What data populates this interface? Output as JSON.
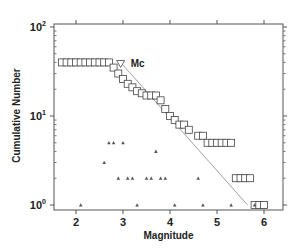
{
  "chart_data": {
    "type": "scatter",
    "title": "",
    "xlabel": "Magnitude",
    "ylabel": "Cumulative Number",
    "xlim": [
      1.6,
      6.4
    ],
    "ylim": [
      0.9,
      110
    ],
    "yscale": "log",
    "grid": false,
    "x_ticks": [
      2,
      3,
      4,
      5,
      6
    ],
    "y_ticks": [
      {
        "value": 1,
        "label": "10^0"
      },
      {
        "value": 10,
        "label": "10^1"
      },
      {
        "value": 100,
        "label": "10^2"
      }
    ],
    "annotations": [
      {
        "text": "Mc",
        "marker": "inverted-triangle",
        "x": 2.95,
        "y": 41
      }
    ],
    "series": [
      {
        "name": "Cumulative number",
        "marker": "square",
        "x": [
          1.7,
          1.8,
          1.9,
          2.0,
          2.1,
          2.2,
          2.3,
          2.4,
          2.5,
          2.6,
          2.7,
          2.8,
          2.9,
          3.0,
          3.1,
          3.2,
          3.3,
          3.4,
          3.5,
          3.6,
          3.7,
          3.8,
          3.9,
          4.0,
          4.1,
          4.2,
          4.3,
          4.4,
          4.6,
          4.7,
          4.8,
          4.9,
          5.0,
          5.1,
          5.2,
          5.3,
          5.4,
          5.5,
          5.6,
          5.7,
          5.8,
          5.9,
          6.0
        ],
        "y": [
          40,
          40,
          40,
          40,
          40,
          40,
          40,
          40,
          40,
          40,
          40,
          35,
          30,
          26,
          23,
          21,
          19,
          18,
          17,
          17,
          17,
          15,
          12,
          10,
          9,
          8,
          8,
          7,
          6,
          6,
          5,
          5,
          5,
          5,
          5,
          5,
          2,
          2,
          2,
          2,
          1,
          1,
          1
        ]
      },
      {
        "name": "Non-cumulative number",
        "marker": "triangle",
        "x": [
          2.1,
          2.6,
          2.7,
          2.8,
          3.0,
          2.9,
          3.1,
          3.2,
          3.3,
          3.5,
          3.6,
          3.7,
          3.8,
          3.9,
          4.1,
          4.6,
          4.7,
          5.3,
          5.8
        ],
        "y": [
          1,
          3,
          5,
          5,
          5,
          2,
          2,
          2,
          1,
          2,
          2,
          4,
          2,
          2,
          1,
          2,
          1,
          1,
          1
        ]
      },
      {
        "name": "Fitted G-R line",
        "type": "line",
        "x": [
          2.95,
          5.65
        ],
        "y": [
          40,
          1
        ]
      }
    ]
  },
  "labels": {
    "x_axis": "Magnitude",
    "y_axis": "Cumulative Number",
    "mc": "Mc"
  }
}
